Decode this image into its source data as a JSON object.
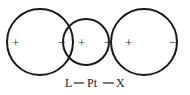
{
  "diagram": {
    "lobes": [
      {
        "id": "left",
        "signs": [
          "+",
          "−"
        ]
      },
      {
        "id": "middle",
        "signs": [
          "+",
          "−"
        ]
      },
      {
        "id": "right",
        "signs": [
          "+",
          "−"
        ]
      }
    ],
    "caption": {
      "ligand": "L",
      "metal": "Pt",
      "halide": "X"
    },
    "colors": {
      "stroke": "#1a1a1a",
      "text": "#222222"
    }
  }
}
